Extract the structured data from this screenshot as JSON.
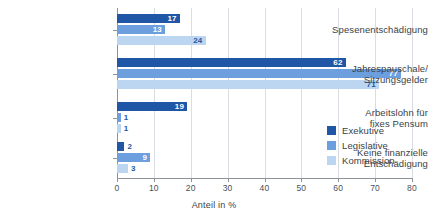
{
  "chart_data": {
    "type": "bar",
    "orientation": "horizontal",
    "title": "",
    "xlabel": "Anteil in %",
    "ylabel": "",
    "xlim": [
      0,
      80
    ],
    "xticks": [
      0,
      10,
      20,
      30,
      40,
      50,
      60,
      70,
      80
    ],
    "xtick_labels": [
      "0",
      "10",
      "20",
      "30",
      "40",
      "50",
      "60",
      "70",
      "80"
    ],
    "grid": "vertical",
    "legend_position": "inside-right",
    "categories": [
      "Spesenentschädigung",
      "Jahrespauschale/\nSitzungsgelder",
      "Arbeitslohn für\nfixes Pensum",
      "Keine finanzielle\nEntschädigung"
    ],
    "category_lines": [
      [
        "Spesenentschädigung"
      ],
      [
        "Jahrespauschale/",
        "Sitzungsgelder"
      ],
      [
        "Arbeitslohn für",
        "fixes Pensum"
      ],
      [
        "Keine finanzielle",
        "Entschädigung"
      ]
    ],
    "series": [
      {
        "name": "Exekutive",
        "color": "#1f56a6",
        "values": [
          17,
          62,
          19,
          2
        ]
      },
      {
        "name": "Legislative",
        "color": "#6d9edd",
        "values": [
          13,
          77,
          1,
          9
        ]
      },
      {
        "name": "Kommission",
        "color": "#bcd6f2",
        "values": [
          24,
          71,
          1,
          3
        ]
      }
    ],
    "value_labels": [
      [
        "17",
        "13",
        "24"
      ],
      [
        "62",
        "77",
        "71"
      ],
      [
        "19",
        "1",
        "1"
      ],
      [
        "2",
        "9",
        "3"
      ]
    ]
  },
  "legend": {
    "items": [
      {
        "label": "Exekutive"
      },
      {
        "label": "Legislative"
      },
      {
        "label": "Kommission"
      }
    ]
  },
  "axis": {
    "x_title": "Anteil in %"
  }
}
